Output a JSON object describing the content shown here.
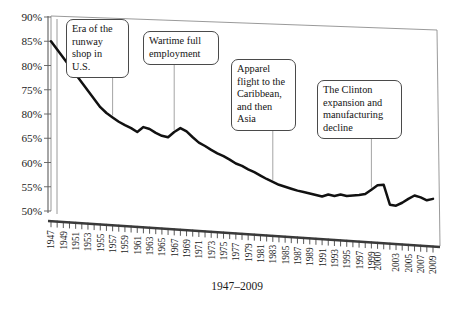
{
  "chart_data": {
    "type": "line",
    "title": "",
    "subtitle": "1947–2009",
    "xlabel": "",
    "ylabel": "",
    "ylim": [
      50,
      90
    ],
    "grid": false,
    "legend": "none",
    "y_tick_labels": [
      "90%",
      "85%",
      "80%",
      "75%",
      "80%",
      "65%",
      "60%",
      "55%",
      "50%"
    ],
    "y_tick_values": [
      90,
      85,
      80,
      75,
      70,
      65,
      60,
      55,
      50
    ],
    "x_tick_labels": [
      "1947",
      "1949",
      "1951",
      "1953",
      "1955",
      "1957",
      "1959",
      "1961",
      "1963",
      "1965",
      "1967",
      "1969",
      "1971",
      "1973",
      "1975",
      "1977",
      "1979",
      "1981",
      "1983",
      "1985",
      "1987",
      "1989",
      "1991",
      "1993",
      "1995",
      "1997",
      "1999",
      "2000",
      "2003",
      "2005",
      "2007",
      "2009"
    ],
    "x": [
      1947,
      1948,
      1949,
      1950,
      1951,
      1952,
      1953,
      1954,
      1955,
      1956,
      1957,
      1958,
      1959,
      1960,
      1961,
      1962,
      1963,
      1964,
      1965,
      1966,
      1967,
      1968,
      1969,
      1970,
      1971,
      1972,
      1973,
      1974,
      1975,
      1976,
      1977,
      1978,
      1979,
      1980,
      1981,
      1982,
      1983,
      1984,
      1985,
      1986,
      1987,
      1988,
      1989,
      1990,
      1991,
      1992,
      1993,
      1994,
      1995,
      1996,
      1997,
      1998,
      1999,
      2000,
      2001,
      2002,
      2003,
      2004,
      2005,
      2006,
      2007,
      2008,
      2009
    ],
    "values": [
      85.0,
      83.3,
      81.6,
      79.9,
      78.2,
      76.5,
      74.8,
      73.1,
      71.4,
      70.2,
      69.3,
      68.4,
      67.7,
      67.1,
      66.3,
      67.3,
      66.9,
      66.1,
      65.5,
      65.2,
      66.3,
      67.1,
      66.4,
      65.2,
      64.1,
      63.4,
      62.6,
      61.9,
      61.3,
      60.6,
      59.8,
      59.3,
      58.6,
      58.0,
      57.3,
      56.6,
      56.0,
      55.4,
      55.0,
      54.6,
      54.2,
      53.9,
      53.6,
      53.3,
      53.0,
      53.4,
      53.1,
      53.4,
      53.1,
      53.2,
      53.3,
      53.5,
      54.4,
      55.3,
      55.4,
      51.3,
      51.1,
      51.7,
      52.5,
      53.2,
      52.8,
      52.2,
      52.5
    ],
    "series_name": "Value",
    "annotations": [
      {
        "id": "annotation-runway-shop",
        "text": "Era of the\nrunway\nshop in\nU.S.",
        "anchor_year": 1957
      },
      {
        "id": "annotation-wartime-employment",
        "text": "Wartime full\nemployment",
        "anchor_year": 1967
      },
      {
        "id": "annotation-apparel-flight",
        "text": "Apparel\nflight to the\nCaribbean,\nand then\nAsia",
        "anchor_year": 1983
      },
      {
        "id": "annotation-clinton-expansion",
        "text": "The Clinton\nexpansion and\nmanufacturing\ndecline",
        "anchor_year": 1999
      }
    ]
  }
}
